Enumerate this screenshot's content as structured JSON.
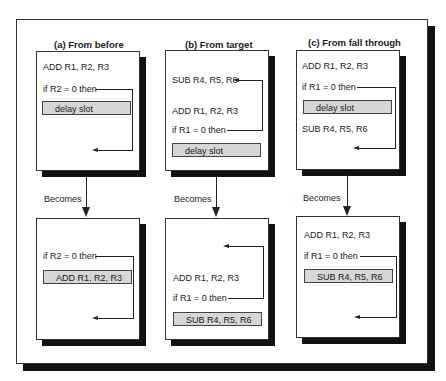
{
  "panels": [
    {
      "title": "(a)  From before",
      "before": {
        "lines": [
          "ADD R1, R2, R3",
          "if R2 = 0 then"
        ],
        "slot": "delay slot"
      },
      "becomes": "Becomes",
      "after": {
        "lines": [
          "if R2 = 0 then"
        ],
        "slot": "ADD R1, R2, R3"
      }
    },
    {
      "title": "(b)  From target",
      "before": {
        "lines": [
          "SUB R4, R5, R6",
          "ADD R1, R2, R3",
          "if R1 = 0 then"
        ],
        "slot": "delay slot"
      },
      "becomes": "Becomes",
      "after": {
        "lines": [
          "ADD R1, R2, R3",
          "if R1 = 0 then"
        ],
        "slot": "SUB R4, R5, R6"
      }
    },
    {
      "title": "(c)  From fall through",
      "before": {
        "lines": [
          "ADD R1, R2, R3",
          "if R1 = 0 then",
          "SUB R4, R5, R6"
        ],
        "slot": "delay slot"
      },
      "becomes": "Becomes",
      "after": {
        "lines": [
          "ADD R1, R2, R3",
          "if R1 = 0 then"
        ],
        "slot": "SUB R4, R5, R6"
      }
    }
  ],
  "colors": {
    "slot_fill": "#d6d6d6",
    "shadow": "#111111",
    "line": "#222222"
  }
}
